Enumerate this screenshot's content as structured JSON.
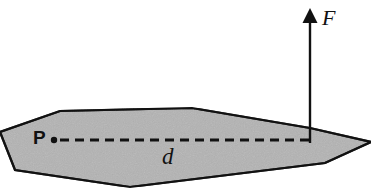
{
  "figure": {
    "background_color": "#ffffff",
    "body": {
      "name": "rigid-body-shape",
      "fill_color": "#b3b3b3",
      "stroke_color": "#111111",
      "stroke_width": 2.2,
      "vertices": [
        [
          0,
          132
        ],
        [
          60,
          111
        ],
        [
          192,
          108
        ],
        [
          310,
          128
        ],
        [
          371,
          142
        ],
        [
          325,
          163
        ],
        [
          130,
          187
        ],
        [
          15,
          170
        ]
      ]
    },
    "pivot": {
      "name": "pivot-point-P",
      "label": "P",
      "label_color": "#111111",
      "dot_color": "#111111",
      "dot_x": 54,
      "dot_y": 140,
      "dot_radius": 3.2
    },
    "moment_arm": {
      "name": "moment-arm-distance-d",
      "label": "d",
      "label_color": "#111111",
      "line_color": "#111111",
      "line_width": 3,
      "dash_pattern": "9 6",
      "x_start": 60,
      "x_end": 311,
      "y": 140
    },
    "force": {
      "name": "force-vector-F",
      "label": "F",
      "label_color": "#111111",
      "color": "#111111",
      "shaft_width": 2.4,
      "x": 310,
      "y_tail": 143,
      "y_head": 8,
      "arrowhead_half_width": 7.5,
      "arrowhead_height": 15
    }
  }
}
